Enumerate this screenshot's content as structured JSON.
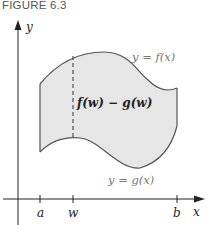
{
  "figure": {
    "caption": "FIGURE 6.3"
  },
  "axes": {
    "x_label": "x",
    "y_label": "y",
    "ticks": [
      {
        "label": "a",
        "x": 40
      },
      {
        "label": "w",
        "x": 73
      },
      {
        "label": "b",
        "x": 177
      }
    ]
  },
  "curves": {
    "upper_label": "y = f(x)",
    "lower_label": "y = g(x)"
  },
  "annotation": {
    "difference_label": "f(w) − g(w)"
  },
  "colors": {
    "region_fill": "#e6e6e6",
    "curve_stroke": "#555555",
    "axis_stroke": "#222222",
    "label_gray": "#777777",
    "text_dark": "#222222"
  }
}
